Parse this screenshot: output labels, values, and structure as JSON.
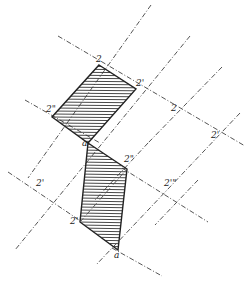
{
  "diagram": {
    "width": 248,
    "height": 286,
    "background": "#ffffff",
    "line_color": "#555555",
    "edge_color": "#222222",
    "hatch_spacing": 3,
    "construction_lines": [
      {
        "x1": 58,
        "y1": 36,
        "x2": 245,
        "y2": 146
      },
      {
        "x1": 25,
        "y1": 100,
        "x2": 100,
        "y2": 143
      },
      {
        "x1": 8,
        "y1": 172,
        "x2": 82,
        "y2": 222
      },
      {
        "x1": 122,
        "y1": 168,
        "x2": 208,
        "y2": 222
      },
      {
        "x1": 112,
        "y1": 248,
        "x2": 162,
        "y2": 276
      },
      {
        "x1": 151,
        "y1": 5,
        "x2": 28,
        "y2": 178
      },
      {
        "x1": 190,
        "y1": 36,
        "x2": 15,
        "y2": 250
      },
      {
        "x1": 222,
        "y1": 67,
        "x2": 148,
        "y2": 143
      },
      {
        "x1": 148,
        "y1": 143,
        "x2": 95,
        "y2": 200
      },
      {
        "x1": 240,
        "y1": 113,
        "x2": 96,
        "y2": 265
      },
      {
        "x1": 198,
        "y1": 180,
        "x2": 155,
        "y2": 225
      }
    ],
    "shapes": [
      {
        "name": "upper-parallelogram",
        "points": [
          [
            99,
            65
          ],
          [
            136,
            89
          ],
          [
            88,
            143
          ],
          [
            52,
            117
          ]
        ]
      },
      {
        "name": "lower-parallelogram",
        "points": [
          [
            88,
            143
          ],
          [
            127,
            169
          ],
          [
            118,
            250
          ],
          [
            80,
            222
          ]
        ]
      }
    ],
    "labels": [
      {
        "text": "2",
        "x": 96,
        "y": 62
      },
      {
        "text": "2'",
        "x": 136,
        "y": 86
      },
      {
        "text": "2\"",
        "x": 46,
        "y": 112
      },
      {
        "text": "2",
        "x": 171,
        "y": 111
      },
      {
        "text": "2'",
        "x": 211,
        "y": 138
      },
      {
        "text": "a",
        "x": 82,
        "y": 146
      },
      {
        "text": "2\"",
        "x": 124,
        "y": 162
      },
      {
        "text": "2'",
        "x": 36,
        "y": 186
      },
      {
        "text": "2'\"",
        "x": 164,
        "y": 186
      },
      {
        "text": "2'",
        "x": 70,
        "y": 224
      },
      {
        "text": "a",
        "x": 114,
        "y": 258
      }
    ]
  }
}
